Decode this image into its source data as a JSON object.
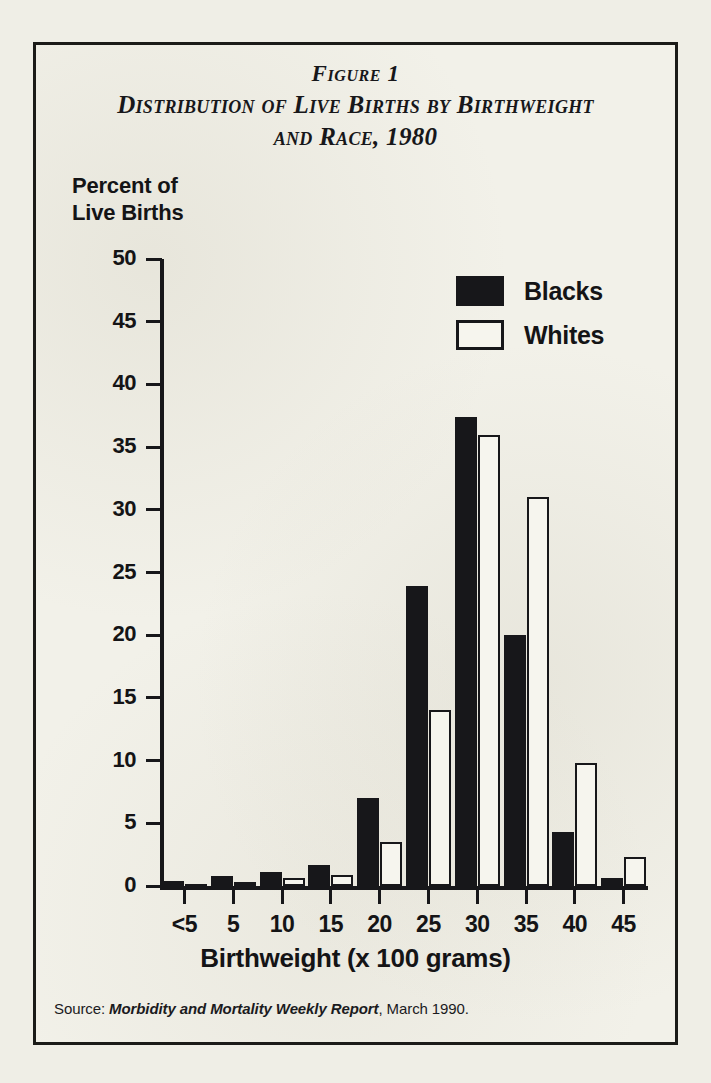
{
  "figure": {
    "title_line_1": "Figure 1",
    "title_line_2": "Distribution of Live Births by Birthweight",
    "title_line_3": "and Race, 1980",
    "source_prefix": "Source:",
    "source_italic": "Morbidity and Mortality Weekly Report",
    "source_suffix": ", March 1990.",
    "frame_color": "#1b1b18",
    "paper_color": "#f2f1e9",
    "ink_color": "#17171a"
  },
  "axes": {
    "y_title_line_1": "Percent of",
    "y_title_line_2": "Live Births",
    "x_title": "Birthweight (x 100 grams)",
    "y_ticks": [
      "50",
      "45",
      "40",
      "35",
      "30",
      "25",
      "20",
      "15",
      "10",
      "5",
      "0"
    ],
    "x_ticks": [
      "<5",
      "5",
      "10",
      "15",
      "20",
      "25",
      "30",
      "35",
      "40",
      "45"
    ]
  },
  "legend": {
    "position": "top-right",
    "items": [
      {
        "label": "Blacks",
        "swatch": "filled",
        "color": "#17171a"
      },
      {
        "label": "Whites",
        "swatch": "hollow",
        "color": "#ffffff"
      }
    ]
  },
  "chart_data": {
    "type": "bar",
    "title": "Distribution of Live Births by Birthweight and Race, 1980",
    "subtitle": "Figure 1",
    "xlabel": "Birthweight (x 100 grams)",
    "ylabel": "Percent of Live Births",
    "categories": [
      "<5",
      "5",
      "10",
      "15",
      "20",
      "25",
      "30",
      "35",
      "40",
      "45"
    ],
    "series": [
      {
        "name": "Blacks",
        "color": "#17171a",
        "values": [
          0.4,
          0.8,
          1.1,
          1.7,
          7.0,
          23.9,
          37.4,
          20.0,
          4.3,
          0.6
        ]
      },
      {
        "name": "Whites",
        "color": "#ffffff",
        "values": [
          0.1,
          0.3,
          0.6,
          0.9,
          3.5,
          14.0,
          36.0,
          31.0,
          9.8,
          2.3
        ]
      }
    ],
    "ylim": [
      0,
      50
    ],
    "ytick_step": 5,
    "grid": false,
    "legend_position": "top-right",
    "source": "Morbidity and Mortality Weekly Report, March 1990."
  }
}
